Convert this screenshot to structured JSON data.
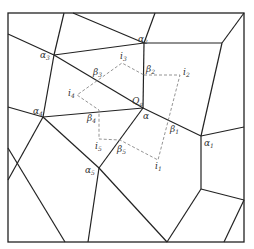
{
  "diagram": {
    "type": "voronoi-mesh",
    "labels": {
      "alpha": "α",
      "alpha1": "α",
      "alpha1_sub": "1",
      "alpha2": "α",
      "alpha2_sub": "2",
      "alpha3": "α",
      "alpha3_sub": "3",
      "alpha4": "α",
      "alpha4_sub": "4",
      "alpha5": "α",
      "alpha5_sub": "5",
      "beta1": "β",
      "beta1_sub": "1",
      "beta2": "β",
      "beta2_sub": "2",
      "beta3": "β",
      "beta3_sub": "3",
      "beta4": "β",
      "beta4_sub": "4",
      "beta5": "β",
      "beta5_sub": "5",
      "i1": "i",
      "i1_sub": "1",
      "i2": "i",
      "i2_sub": "2",
      "i3": "i",
      "i3_sub": "3",
      "i4": "i",
      "i4_sub": "4",
      "i5": "i",
      "i5_sub": "5",
      "q": "Q",
      "q_sub": "a"
    },
    "colors": {
      "edge": "#222222",
      "dashed": "#888888",
      "label": "#333333"
    }
  }
}
